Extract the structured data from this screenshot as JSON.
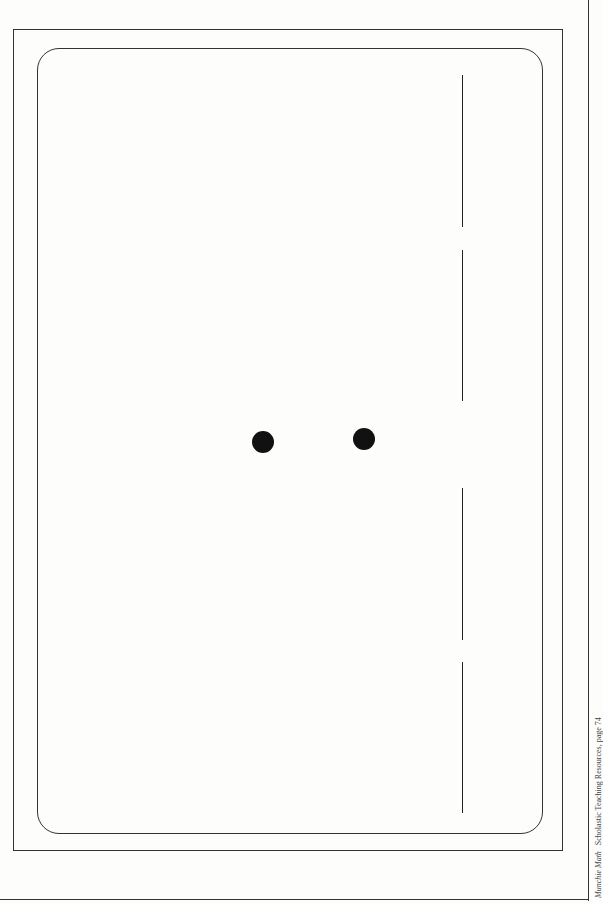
{
  "page": {
    "footer": {
      "book_title": "Munchie Math",
      "publisher_ref": "Scholastic Teaching Resources, page 74"
    },
    "card": {
      "dots": [
        {
          "cx": 263,
          "cy": 442
        },
        {
          "cx": 364,
          "cy": 439
        }
      ],
      "fold_line_segments": [
        {
          "y1": 75,
          "y2": 227
        },
        {
          "y1": 250,
          "y2": 401
        },
        {
          "y1": 488,
          "y2": 640
        },
        {
          "y1": 662,
          "y2": 813
        }
      ]
    },
    "colors": {
      "ink": "#222222",
      "paper": "#fdfdfc"
    }
  }
}
